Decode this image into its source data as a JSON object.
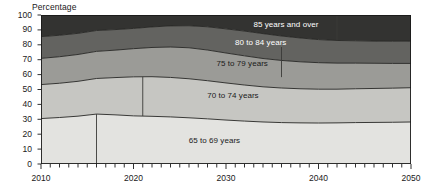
{
  "chart_data": {
    "type": "area",
    "subtype": "stacked-100-percent",
    "title": "",
    "ylabel": "Percentage",
    "xlabel": "",
    "ylim": [
      0,
      100
    ],
    "xlim": [
      2010,
      2050
    ],
    "yticks": [
      0,
      10,
      20,
      30,
      40,
      50,
      60,
      70,
      80,
      90,
      100
    ],
    "xticks": [
      2010,
      2020,
      2030,
      2040,
      2050
    ],
    "x_minor_tick_interval": 1,
    "grid": false,
    "legend_position": "inline-labels",
    "x": [
      2010,
      2012,
      2014,
      2016,
      2018,
      2020,
      2022,
      2024,
      2026,
      2028,
      2030,
      2032,
      2034,
      2036,
      2038,
      2040,
      2042,
      2044,
      2046,
      2048,
      2050
    ],
    "series": [
      {
        "name": "65 to 69 years",
        "color": "#e3e3e0",
        "values": [
          30.5,
          31.2,
          32.1,
          33.5,
          33.0,
          32.3,
          32.0,
          31.6,
          31.0,
          30.3,
          29.5,
          28.8,
          28.2,
          27.8,
          27.6,
          27.5,
          27.6,
          27.8,
          27.9,
          28.0,
          28.2
        ]
      },
      {
        "name": "70 to 74 years",
        "color": "#c6c6c2",
        "values": [
          22.8,
          23.0,
          23.4,
          23.9,
          25.0,
          26.2,
          26.6,
          26.5,
          26.2,
          25.6,
          24.9,
          24.2,
          23.6,
          23.2,
          22.9,
          22.7,
          22.6,
          22.7,
          22.8,
          22.9,
          23.0
        ]
      },
      {
        "name": "75 to 79 years",
        "color": "#9b9b97",
        "values": [
          17.6,
          17.8,
          18.0,
          18.2,
          18.4,
          18.9,
          19.6,
          20.4,
          20.8,
          20.6,
          20.1,
          19.6,
          19.0,
          18.5,
          18.1,
          17.8,
          17.5,
          17.2,
          16.9,
          16.6,
          16.3
        ]
      },
      {
        "name": "80 to 84 years",
        "color": "#636360",
        "values": [
          14.6,
          14.4,
          14.2,
          14.0,
          13.8,
          13.6,
          13.8,
          14.2,
          14.8,
          15.6,
          16.2,
          16.6,
          16.7,
          16.4,
          16.0,
          15.5,
          15.2,
          15.0,
          14.9,
          14.9,
          15.0
        ]
      },
      {
        "name": "85 years and over",
        "color": "#333331",
        "values": [
          14.5,
          13.6,
          12.3,
          10.4,
          9.8,
          9.0,
          8.0,
          7.3,
          7.2,
          7.9,
          9.3,
          10.8,
          12.5,
          14.1,
          15.4,
          16.5,
          17.1,
          17.3,
          17.5,
          17.6,
          17.5
        ]
      }
    ],
    "cumulative_boundaries": {
      "note": "Upper edge of each band in percent, bottom to top",
      "b1_65to69": [
        30.5,
        31.2,
        32.1,
        33.5,
        33.0,
        32.3,
        32.0,
        31.6,
        31.0,
        30.3,
        29.5,
        28.8,
        28.2,
        27.8,
        27.6,
        27.5,
        27.6,
        27.8,
        27.9,
        28.0,
        28.2
      ],
      "b2_70to74": [
        53.3,
        54.2,
        55.5,
        57.4,
        58.0,
        58.5,
        58.6,
        58.1,
        57.2,
        55.9,
        54.4,
        53.0,
        51.8,
        51.0,
        50.5,
        50.2,
        50.2,
        50.5,
        50.7,
        50.9,
        51.2
      ],
      "b3_75to79": [
        70.9,
        72.0,
        73.5,
        75.6,
        76.4,
        77.4,
        78.2,
        78.5,
        78.0,
        76.5,
        74.5,
        72.6,
        70.8,
        69.5,
        68.6,
        68.0,
        67.7,
        67.7,
        67.6,
        67.5,
        67.5
      ],
      "b4_80to84": [
        85.5,
        86.4,
        87.7,
        89.6,
        90.2,
        91.0,
        92.0,
        92.7,
        92.8,
        92.1,
        90.7,
        89.2,
        87.5,
        85.9,
        84.6,
        83.5,
        82.9,
        82.7,
        82.5,
        82.4,
        82.5
      ],
      "b5_85plus": [
        100,
        100,
        100,
        100,
        100,
        100,
        100,
        100,
        100,
        100,
        100,
        100,
        100,
        100,
        100,
        100,
        100,
        100,
        100,
        100,
        100
      ]
    },
    "internal_vertical_rules": [
      {
        "x": 2016,
        "from": 0,
        "to": 33.5
      },
      {
        "x": 2021,
        "from": 32.2,
        "to": 58.5
      },
      {
        "x": 2036,
        "from": 58.3,
        "to": 78.5
      },
      {
        "x": 2042,
        "from": 82.9,
        "to": 100
      }
    ],
    "band_labels": [
      {
        "text": "85 years and over",
        "x": 2036,
        "y": 93
      },
      {
        "text": "80 to 84 years",
        "x": 2034,
        "y": 81
      },
      {
        "text": "75 to 79 years",
        "x": 2032,
        "y": 67
      },
      {
        "text": "70 to 74 years",
        "x": 2031,
        "y": 45
      },
      {
        "text": "65 to 69 years",
        "x": 2029,
        "y": 15
      }
    ]
  },
  "axis": {
    "ylabel": "Percentage",
    "ytick_labels": [
      "100",
      "90",
      "80",
      "70",
      "60",
      "50",
      "40",
      "30",
      "20",
      "10",
      "0"
    ],
    "xtick_labels": [
      "2010",
      "2020",
      "2030",
      "2040",
      "2050"
    ]
  },
  "colors": {
    "band_65_69": "#e3e3e0",
    "band_70_74": "#c6c6c2",
    "band_75_79": "#9b9b97",
    "band_80_84": "#636360",
    "band_85_plus": "#333331",
    "axis": "#1a1a1a",
    "label_dark": "#1a1a1a",
    "label_light": "#ffffff",
    "background": "#ffffff"
  }
}
